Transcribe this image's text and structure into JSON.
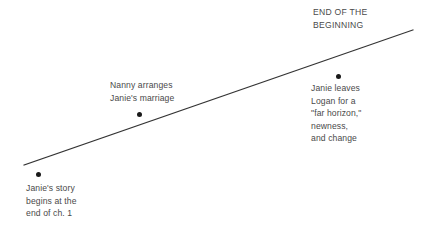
{
  "chart_data": {
    "type": "line",
    "title": "END OF THE BEGINNING",
    "title_lines": [
      "END OF THE",
      "BEGINNING"
    ],
    "xlabel": "",
    "ylabel": "",
    "grid": false,
    "legend": null,
    "line": {
      "name": "rising-action-arc",
      "color": "#333333",
      "x": [
        24,
        413
      ],
      "y": [
        165,
        30
      ],
      "direction": "ascending"
    },
    "points": [
      {
        "name": "janies-story-begins",
        "x": 38,
        "y": 174,
        "label_lines": [
          "Janie's story",
          "begins at the",
          "end of ch. 1"
        ],
        "label_position": "below"
      },
      {
        "name": "nanny-arranges-marriage",
        "x": 139,
        "y": 114,
        "label_lines": [
          "Nanny arranges",
          "Janie's marriage"
        ],
        "label_position": "above"
      },
      {
        "name": "janie-leaves-logan",
        "x": 338,
        "y": 76,
        "label_lines": [
          "Janie leaves",
          "Logan for a",
          "\"far horizon,\"",
          "newness,",
          "and change"
        ],
        "label_position": "below"
      }
    ]
  },
  "colors": {
    "background": "#ffffff",
    "line": "#333333",
    "dot": "#1a1a1a",
    "text": "#4a4a4a"
  }
}
